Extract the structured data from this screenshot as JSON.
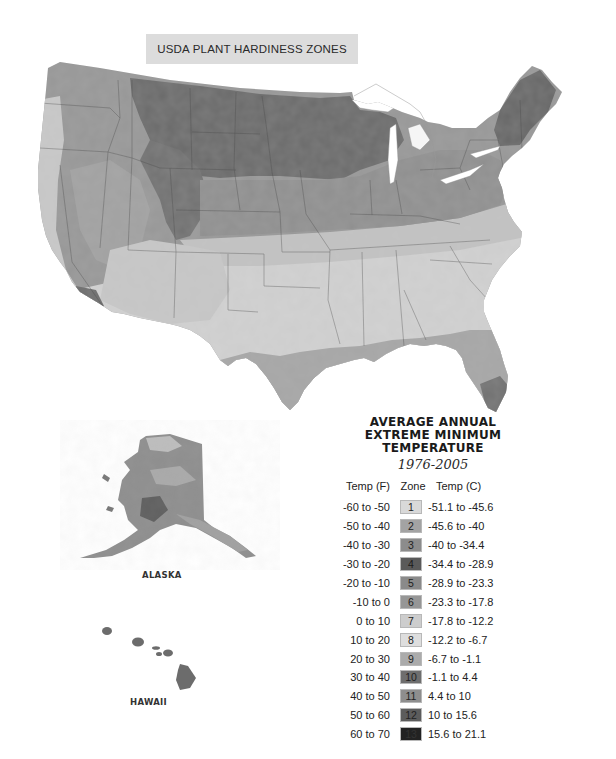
{
  "header": {
    "cut_off_text": "                                                                  ",
    "title": "USDA PLANT HARDINESS ZONES"
  },
  "map": {
    "regions": [
      "Contiguous United States",
      "Alaska",
      "Hawaii"
    ],
    "insets": {
      "alaska_label": "ALASKA",
      "hawaii_label": "HAWAII"
    }
  },
  "legend": {
    "title_line1": "AVERAGE ANNUAL",
    "title_line2": "EXTREME MINIMUM",
    "title_line3": "TEMPERATURE",
    "years": "1976-2005",
    "col_f": "Temp (F)",
    "col_zone": "Zone",
    "col_c": "Temp (C)",
    "rows": [
      {
        "f": "-60 to -50",
        "zone": "1",
        "c": "-51.1 to -45.6",
        "color": "#d9d9d9",
        "text": "#222"
      },
      {
        "f": "-50 to -40",
        "zone": "2",
        "c": "-45.6 to -40",
        "color": "#a3a3a3",
        "text": "#222"
      },
      {
        "f": "-40 to -30",
        "zone": "3",
        "c": "-40 to -34.4",
        "color": "#8c8c8c",
        "text": "#222"
      },
      {
        "f": "-30 to -20",
        "zone": "4",
        "c": "-34.4 to -28.9",
        "color": "#5a5a5a",
        "text": "#1a1a1a"
      },
      {
        "f": "-20 to -10",
        "zone": "5",
        "c": "-28.9 to -23.3",
        "color": "#8a8a8a",
        "text": "#222"
      },
      {
        "f": "-10 to 0",
        "zone": "6",
        "c": "-23.3 to -17.8",
        "color": "#969696",
        "text": "#222"
      },
      {
        "f": "0 to 10",
        "zone": "7",
        "c": "-17.8 to -12.2",
        "color": "#cdcdcd",
        "text": "#222"
      },
      {
        "f": "10 to 20",
        "zone": "8",
        "c": "-12.2 to -6.7",
        "color": "#dedede",
        "text": "#222"
      },
      {
        "f": "20 to 30",
        "zone": "9",
        "c": "-6.7 to -1.1",
        "color": "#ababab",
        "text": "#222"
      },
      {
        "f": "30 to 40",
        "zone": "10",
        "c": "-1.1 to 4.4",
        "color": "#6e6e6e",
        "text": "#222"
      },
      {
        "f": "40 to 50",
        "zone": "11",
        "c": "4.4 to 10",
        "color": "#8e8e8e",
        "text": "#222"
      },
      {
        "f": "50 to 60",
        "zone": "12",
        "c": "10 to 15.6",
        "color": "#5c5c5c",
        "text": "#222"
      },
      {
        "f": "60 to 70",
        "zone": "13",
        "c": "15.6 to 21.1",
        "color": "#222222",
        "text": "#333"
      }
    ]
  }
}
